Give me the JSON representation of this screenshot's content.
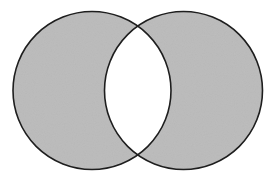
{
  "diagram": {
    "type": "venn",
    "title": "",
    "shaded_region": "symmetric difference (A △ B)",
    "sets": [
      {
        "id": "A",
        "label": "",
        "cx": 92,
        "cy": 90.5,
        "r": 79
      },
      {
        "id": "B",
        "label": "",
        "cx": 183.5,
        "cy": 90.5,
        "r": 79
      }
    ],
    "regions": [
      {
        "id": "A-only",
        "shaded": true
      },
      {
        "id": "B-only",
        "shaded": true
      },
      {
        "id": "A-and-B",
        "shaded": false
      }
    ],
    "colors": {
      "fill": "#bdbdbd",
      "intersection": "#ffffff",
      "stroke": "#1e1e1e",
      "background": "#ffffff"
    }
  }
}
